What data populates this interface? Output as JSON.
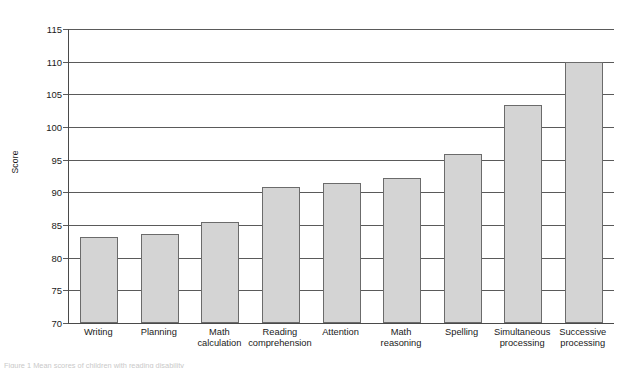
{
  "chart_data": {
    "type": "bar",
    "title": "",
    "xlabel": "",
    "ylabel": "Score",
    "ylim": [
      70,
      115
    ],
    "ystep": 5,
    "yticks": [
      115,
      110,
      105,
      100,
      95,
      90,
      85,
      80,
      75,
      70
    ],
    "grid": true,
    "legend": "none",
    "categories": [
      "Writing",
      "Planning",
      "Math calculation",
      "Reading comprehension",
      "Attention",
      "Math reasoning",
      "Spelling",
      "Simultaneous processing",
      "Successive processing"
    ],
    "category_lines": [
      [
        "Writing"
      ],
      [
        "Planning"
      ],
      [
        "Math",
        "calculation"
      ],
      [
        "Reading",
        "comprehension"
      ],
      [
        "Attention"
      ],
      [
        "Math",
        "reasoning"
      ],
      [
        "Spelling"
      ],
      [
        "Simultaneous",
        "processing"
      ],
      [
        "Successive",
        "processing"
      ]
    ],
    "values": [
      83.2,
      83.6,
      85.5,
      90.8,
      91.5,
      92.2,
      95.8,
      103.4,
      110.0
    ],
    "bar_fill": "#d4d4d4",
    "bar_border": "#6b6b6b",
    "axis_color": "#5a5a5a"
  },
  "caption": {
    "text": "Figure 1  Mean scores of children with reading disability"
  }
}
